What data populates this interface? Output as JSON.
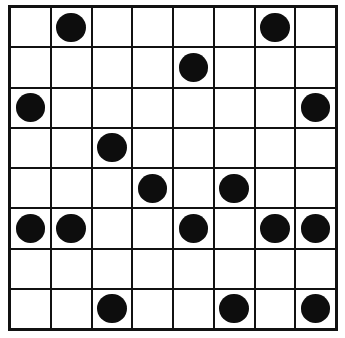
{
  "puzzle": {
    "kind": "dot-grid",
    "rows": 8,
    "columns": 8,
    "cell_label_filled": "filled",
    "cell_label_empty": "empty",
    "dot_count": 16,
    "colors": {
      "background": "#ffffff",
      "grid_line": "#111111",
      "dot_fill": "#0d0d0d"
    },
    "grid": [
      [
        0,
        1,
        0,
        0,
        0,
        0,
        1,
        0
      ],
      [
        0,
        0,
        0,
        0,
        1,
        0,
        0,
        0
      ],
      [
        1,
        0,
        0,
        0,
        0,
        0,
        0,
        1
      ],
      [
        0,
        0,
        1,
        0,
        0,
        0,
        0,
        0
      ],
      [
        0,
        0,
        0,
        1,
        0,
        1,
        0,
        0
      ],
      [
        1,
        1,
        0,
        0,
        1,
        0,
        1,
        1
      ],
      [
        0,
        0,
        0,
        0,
        0,
        0,
        0,
        0
      ],
      [
        0,
        0,
        1,
        0,
        0,
        1,
        0,
        1
      ]
    ]
  }
}
